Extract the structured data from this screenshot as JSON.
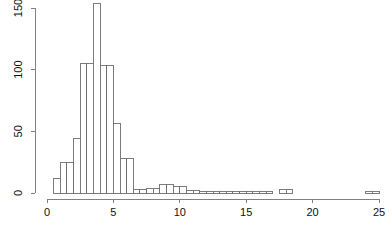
{
  "chart_data": {
    "type": "bar",
    "subtype": "histogram",
    "title": "",
    "subtitle": "",
    "xlabel": "",
    "ylabel": "",
    "xlim": [
      0,
      25
    ],
    "ylim": [
      0,
      155
    ],
    "grid": false,
    "legend": false,
    "legend_position": "none",
    "bin_width": 0.5,
    "bar_fill_color": "#ffffff",
    "bar_border_color": "#6e6e6e",
    "axis_color": "#808080",
    "background_color": "#ffffff",
    "text_color": "#111111",
    "x_ticks": [
      {
        "value": 0,
        "label": "0"
      },
      {
        "value": 5,
        "label": "5"
      },
      {
        "value": 10,
        "label": "10"
      },
      {
        "value": 15,
        "label": "15"
      },
      {
        "value": 20,
        "label": "20"
      },
      {
        "value": 25,
        "label": "25"
      }
    ],
    "y_ticks": [
      {
        "value": 0,
        "label": "0"
      },
      {
        "value": 50,
        "label": "50"
      },
      {
        "value": 100,
        "label": "100"
      },
      {
        "value": 150,
        "label": "150"
      }
    ],
    "bins": [
      {
        "x0": 0.0,
        "x1": 0.5,
        "count": 0
      },
      {
        "x0": 0.5,
        "x1": 1.0,
        "count": 12
      },
      {
        "x0": 1.0,
        "x1": 1.5,
        "count": 25
      },
      {
        "x0": 1.5,
        "x1": 2.0,
        "count": 25
      },
      {
        "x0": 2.0,
        "x1": 2.5,
        "count": 44
      },
      {
        "x0": 2.5,
        "x1": 3.0,
        "count": 105
      },
      {
        "x0": 3.0,
        "x1": 3.5,
        "count": 105
      },
      {
        "x0": 3.5,
        "x1": 4.0,
        "count": 154
      },
      {
        "x0": 4.0,
        "x1": 4.5,
        "count": 103
      },
      {
        "x0": 4.5,
        "x1": 5.0,
        "count": 103
      },
      {
        "x0": 5.0,
        "x1": 5.5,
        "count": 56
      },
      {
        "x0": 5.5,
        "x1": 6.0,
        "count": 28
      },
      {
        "x0": 6.0,
        "x1": 6.5,
        "count": 28
      },
      {
        "x0": 6.5,
        "x1": 7.0,
        "count": 3
      },
      {
        "x0": 7.0,
        "x1": 7.5,
        "count": 3
      },
      {
        "x0": 7.5,
        "x1": 8.0,
        "count": 4
      },
      {
        "x0": 8.0,
        "x1": 8.5,
        "count": 4
      },
      {
        "x0": 8.5,
        "x1": 9.0,
        "count": 7
      },
      {
        "x0": 9.0,
        "x1": 9.5,
        "count": 7
      },
      {
        "x0": 9.5,
        "x1": 10.0,
        "count": 5
      },
      {
        "x0": 10.0,
        "x1": 10.5,
        "count": 5
      },
      {
        "x0": 10.5,
        "x1": 11.0,
        "count": 2
      },
      {
        "x0": 11.0,
        "x1": 11.5,
        "count": 2
      },
      {
        "x0": 11.5,
        "x1": 12.0,
        "count": 1
      },
      {
        "x0": 12.0,
        "x1": 12.5,
        "count": 1
      },
      {
        "x0": 12.5,
        "x1": 13.0,
        "count": 1
      },
      {
        "x0": 13.0,
        "x1": 13.5,
        "count": 1
      },
      {
        "x0": 13.5,
        "x1": 14.0,
        "count": 1
      },
      {
        "x0": 14.0,
        "x1": 14.5,
        "count": 1
      },
      {
        "x0": 14.5,
        "x1": 15.0,
        "count": 1
      },
      {
        "x0": 15.0,
        "x1": 15.5,
        "count": 1
      },
      {
        "x0": 15.5,
        "x1": 16.0,
        "count": 1
      },
      {
        "x0": 16.0,
        "x1": 16.5,
        "count": 1
      },
      {
        "x0": 16.5,
        "x1": 17.0,
        "count": 1
      },
      {
        "x0": 17.0,
        "x1": 17.5,
        "count": 0
      },
      {
        "x0": 17.5,
        "x1": 18.0,
        "count": 3
      },
      {
        "x0": 18.0,
        "x1": 18.5,
        "count": 3
      },
      {
        "x0": 18.5,
        "x1": 19.0,
        "count": 0
      },
      {
        "x0": 19.0,
        "x1": 19.5,
        "count": 0
      },
      {
        "x0": 19.5,
        "x1": 20.0,
        "count": 0
      },
      {
        "x0": 20.0,
        "x1": 20.5,
        "count": 0
      },
      {
        "x0": 20.5,
        "x1": 21.0,
        "count": 0
      },
      {
        "x0": 21.0,
        "x1": 21.5,
        "count": 0
      },
      {
        "x0": 21.5,
        "x1": 22.0,
        "count": 0
      },
      {
        "x0": 22.0,
        "x1": 22.5,
        "count": 0
      },
      {
        "x0": 22.5,
        "x1": 23.0,
        "count": 0
      },
      {
        "x0": 23.0,
        "x1": 23.5,
        "count": 0
      },
      {
        "x0": 23.5,
        "x1": 24.0,
        "count": 0
      },
      {
        "x0": 24.0,
        "x1": 24.5,
        "count": 1
      },
      {
        "x0": 24.5,
        "x1": 25.0,
        "count": 1
      }
    ]
  },
  "plot_geometry": {
    "x_axis_pixel_start": 47,
    "x_axis_pixel_end": 379,
    "y_axis_pixel_zero": 193,
    "y_axis_pixel_top": 8,
    "y_axis_pixel_x": 35,
    "x_axis_pixel_y": 199
  }
}
